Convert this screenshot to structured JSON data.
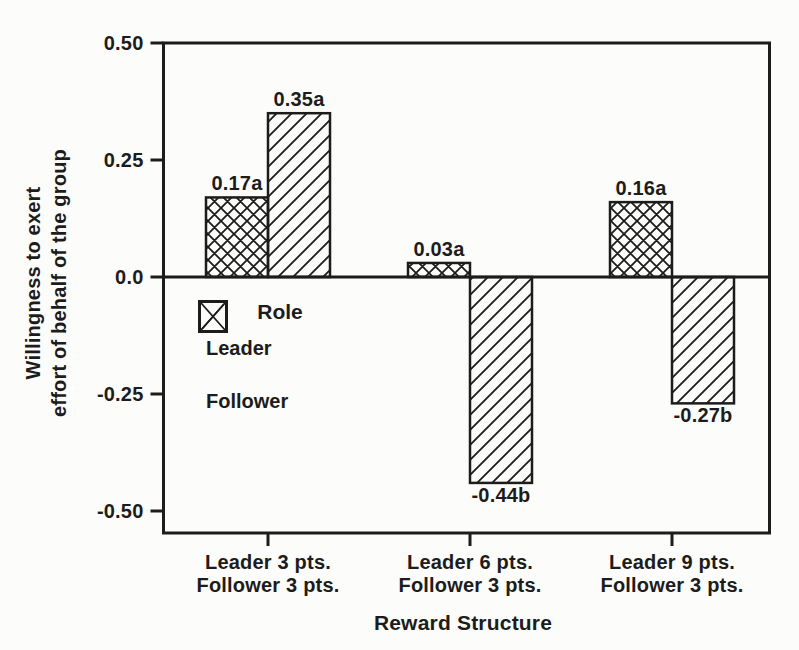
{
  "figure": {
    "background": "#fcfcfa",
    "ink": "#1c1c1c"
  },
  "chart_data": {
    "type": "bar",
    "title": "",
    "xlabel": "Reward Structure",
    "ylabel": "Willingness to exert effort of behalf of the group",
    "ylabel_lines": [
      "Willingness to exert",
      "effort of behalf of the group"
    ],
    "ylim": [
      -0.55,
      0.5
    ],
    "grid": false,
    "yticks": [
      0.5,
      0.25,
      0.0,
      -0.25,
      -0.5
    ],
    "ytick_labels": [
      "0.50",
      "0.25",
      "0.0",
      "-0.25",
      "-0.50"
    ],
    "categories": [
      [
        "Leader 3 pts.",
        "Follower 3 pts."
      ],
      [
        "Leader 6 pts.",
        "Follower 3 pts."
      ],
      [
        "Leader 9 pts.",
        "Follower 3 pts."
      ]
    ],
    "series": [
      {
        "name": "Leader",
        "pattern": "crosshatch",
        "values": [
          0.17,
          0.03,
          0.16
        ],
        "labels": [
          "0.17a",
          "0.03a",
          "0.16a"
        ]
      },
      {
        "name": "Follower",
        "pattern": "diagonal",
        "values": [
          0.35,
          -0.44,
          -0.27
        ],
        "labels": [
          "0.35a",
          "-0.44b",
          "-0.27b"
        ]
      }
    ],
    "legend": {
      "title": "Role",
      "position": "inside-left",
      "entries": [
        "Leader",
        "Follower"
      ]
    }
  }
}
